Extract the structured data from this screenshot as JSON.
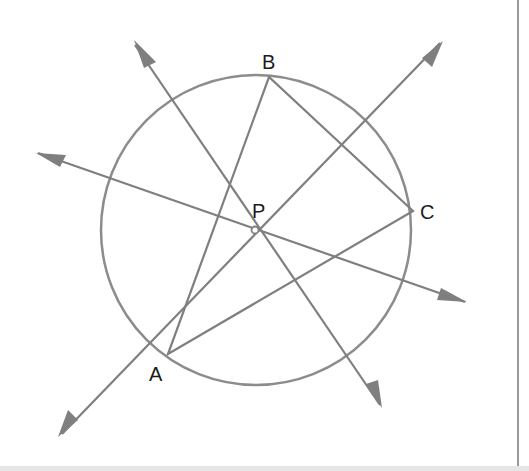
{
  "diagram": {
    "colors": {
      "line": "#7f7f7f",
      "circle": "#8c8c8c",
      "text": "#1a1a1a"
    },
    "circle": {
      "cx": 256,
      "cy": 230,
      "r": 155
    },
    "points": {
      "A": {
        "x": 168,
        "y": 354,
        "label": "A"
      },
      "B": {
        "x": 269,
        "y": 77,
        "label": "B"
      },
      "C": {
        "x": 413,
        "y": 211,
        "label": "C"
      },
      "P": {
        "x": 255,
        "y": 230,
        "label": "P"
      }
    },
    "labels": {
      "A": "A",
      "B": "B",
      "C": "C",
      "P": "P"
    }
  }
}
